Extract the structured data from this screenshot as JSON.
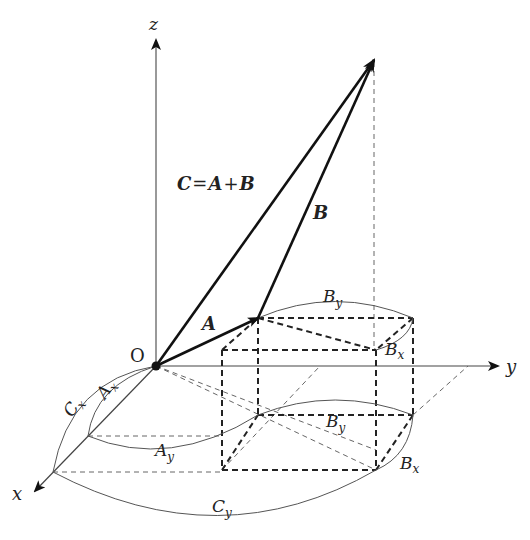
{
  "diagram": {
    "axes": {
      "x_label": "x",
      "y_label": "y",
      "z_label": "z",
      "origin_label": "O"
    },
    "vectors": {
      "A_label": "A",
      "B_label": "B",
      "C_equation": {
        "C": "C",
        "eq": "=",
        "A": "A",
        "plus": "+",
        "B": "B"
      }
    },
    "components": {
      "Ax": {
        "base": "A",
        "sub": "x"
      },
      "Ay": {
        "base": "A",
        "sub": "y"
      },
      "Cx": {
        "base": "C",
        "sub": "x"
      },
      "Cy": {
        "base": "C",
        "sub": "y"
      },
      "By_upper": {
        "base": "B",
        "sub": "y"
      },
      "Bx_upper": {
        "base": "B",
        "sub": "x"
      },
      "By_lower": {
        "base": "B",
        "sub": "y"
      },
      "Bx_lower": {
        "base": "B",
        "sub": "x"
      }
    },
    "colors": {
      "vector": "#111111",
      "axis": "#333333",
      "dashed": "#333333",
      "arc": "#555555"
    }
  }
}
